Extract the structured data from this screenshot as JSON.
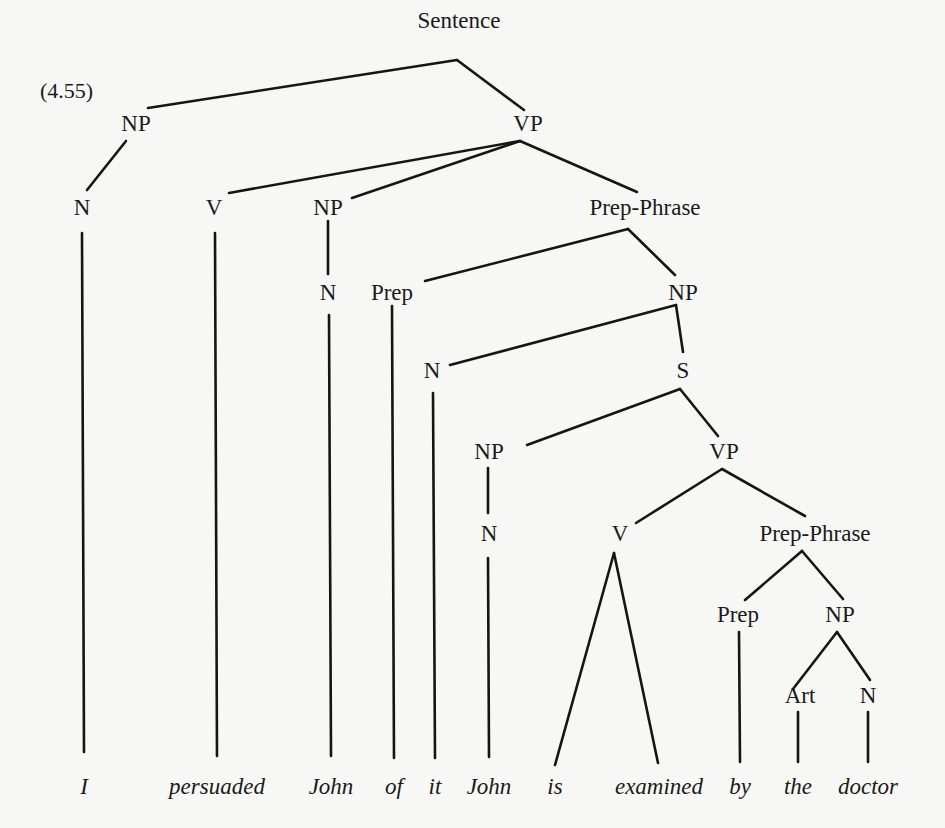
{
  "figure": {
    "example_number": "(4.55)",
    "title_fragment": "",
    "colors": {
      "background": "#f7f7f5",
      "ink": "#1a1a1a"
    }
  },
  "tree": {
    "nodes": [
      {
        "id": "sentence",
        "label": "Sentence",
        "x": 459,
        "y": 28
      },
      {
        "id": "np1",
        "label": "NP",
        "x": 136,
        "y": 131
      },
      {
        "id": "vp1",
        "label": "VP",
        "x": 528,
        "y": 131
      },
      {
        "id": "n1",
        "label": "N",
        "x": 82,
        "y": 215
      },
      {
        "id": "v1",
        "label": "V",
        "x": 214,
        "y": 215
      },
      {
        "id": "np2",
        "label": "NP",
        "x": 328,
        "y": 215
      },
      {
        "id": "pp1",
        "label": "Prep-Phrase",
        "x": 645,
        "y": 215
      },
      {
        "id": "n2",
        "label": "N",
        "x": 328,
        "y": 300
      },
      {
        "id": "prep1",
        "label": "Prep",
        "x": 392,
        "y": 300
      },
      {
        "id": "np3",
        "label": "NP",
        "x": 683,
        "y": 300
      },
      {
        "id": "n3",
        "label": "N",
        "x": 432,
        "y": 378
      },
      {
        "id": "s1",
        "label": "S",
        "x": 683,
        "y": 378
      },
      {
        "id": "np4",
        "label": "NP",
        "x": 489,
        "y": 459
      },
      {
        "id": "vp2",
        "label": "VP",
        "x": 724,
        "y": 459
      },
      {
        "id": "n4",
        "label": "N",
        "x": 489,
        "y": 541
      },
      {
        "id": "v2",
        "label": "V",
        "x": 620,
        "y": 541
      },
      {
        "id": "pp2",
        "label": "Prep-Phrase",
        "x": 815,
        "y": 541
      },
      {
        "id": "prep2",
        "label": "Prep",
        "x": 738,
        "y": 622
      },
      {
        "id": "np5",
        "label": "NP",
        "x": 840,
        "y": 622
      },
      {
        "id": "art1",
        "label": "Art",
        "x": 800,
        "y": 703
      },
      {
        "id": "n5",
        "label": "N",
        "x": 868,
        "y": 703
      }
    ],
    "edges": [
      {
        "x1": 457,
        "y1": 60,
        "x2": 148,
        "y2": 108
      },
      {
        "x1": 457,
        "y1": 60,
        "x2": 524,
        "y2": 110
      },
      {
        "x1": 126,
        "y1": 141,
        "x2": 87,
        "y2": 190
      },
      {
        "x1": 520,
        "y1": 141,
        "x2": 229,
        "y2": 193
      },
      {
        "x1": 520,
        "y1": 141,
        "x2": 352,
        "y2": 198
      },
      {
        "x1": 520,
        "y1": 141,
        "x2": 637,
        "y2": 192
      },
      {
        "x1": 328,
        "y1": 221,
        "x2": 328,
        "y2": 274
      },
      {
        "x1": 628,
        "y1": 229,
        "x2": 425,
        "y2": 281
      },
      {
        "x1": 628,
        "y1": 229,
        "x2": 675,
        "y2": 275
      },
      {
        "x1": 676,
        "y1": 305,
        "x2": 450,
        "y2": 365
      },
      {
        "x1": 676,
        "y1": 305,
        "x2": 683,
        "y2": 352
      },
      {
        "x1": 680,
        "y1": 389,
        "x2": 527,
        "y2": 445
      },
      {
        "x1": 680,
        "y1": 389,
        "x2": 718,
        "y2": 436
      },
      {
        "x1": 488,
        "y1": 468,
        "x2": 488,
        "y2": 513
      },
      {
        "x1": 722,
        "y1": 469,
        "x2": 636,
        "y2": 523
      },
      {
        "x1": 722,
        "y1": 469,
        "x2": 805,
        "y2": 516
      },
      {
        "x1": 802,
        "y1": 551,
        "x2": 745,
        "y2": 600
      },
      {
        "x1": 802,
        "y1": 551,
        "x2": 843,
        "y2": 599
      },
      {
        "x1": 837,
        "y1": 632,
        "x2": 793,
        "y2": 689
      },
      {
        "x1": 837,
        "y1": 632,
        "x2": 870,
        "y2": 680
      },
      {
        "x1": 82,
        "y1": 233,
        "x2": 84,
        "y2": 752
      },
      {
        "x1": 215,
        "y1": 233,
        "x2": 217,
        "y2": 756
      },
      {
        "x1": 329,
        "y1": 315,
        "x2": 331,
        "y2": 756
      },
      {
        "x1": 392,
        "y1": 306,
        "x2": 394,
        "y2": 758
      },
      {
        "x1": 433,
        "y1": 393,
        "x2": 435,
        "y2": 758
      },
      {
        "x1": 488,
        "y1": 558,
        "x2": 489,
        "y2": 757
      },
      {
        "x1": 614,
        "y1": 553,
        "x2": 555,
        "y2": 765
      },
      {
        "x1": 614,
        "y1": 553,
        "x2": 658,
        "y2": 763
      },
      {
        "x1": 739,
        "y1": 632,
        "x2": 740,
        "y2": 762
      },
      {
        "x1": 798,
        "y1": 712,
        "x2": 798,
        "y2": 762
      },
      {
        "x1": 868,
        "y1": 712,
        "x2": 868,
        "y2": 762
      }
    ],
    "words": [
      {
        "text": "I",
        "x": 84
      },
      {
        "text": "persuaded",
        "x": 217
      },
      {
        "text": "John",
        "x": 331
      },
      {
        "text": "of",
        "x": 394
      },
      {
        "text": "it",
        "x": 435
      },
      {
        "text": "John",
        "x": 489
      },
      {
        "text": "is",
        "x": 555
      },
      {
        "text": "examined",
        "x": 659
      },
      {
        "text": "by",
        "x": 740
      },
      {
        "text": "the",
        "x": 798
      },
      {
        "text": "doctor",
        "x": 868
      }
    ],
    "words_baseline_y": 794
  }
}
